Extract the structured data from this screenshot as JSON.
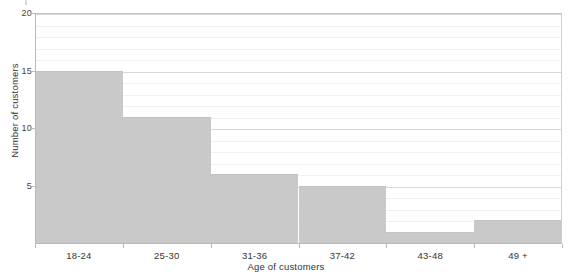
{
  "chart_data": {
    "type": "bar",
    "title": "",
    "subtitle": "",
    "xlabel": "Age of customers",
    "ylabel": "Number of customers",
    "categories": [
      "18-24",
      "25-30",
      "31-36",
      "37-42",
      "43-48",
      "49 +"
    ],
    "values": [
      15,
      11,
      6,
      5,
      1,
      2
    ],
    "series": [
      {
        "name": "Number of customers",
        "values": [
          15,
          11,
          6,
          5,
          1,
          2
        ]
      }
    ],
    "ylim": [
      0,
      20
    ],
    "ytick_labels": [
      "5",
      "10",
      "15",
      "20"
    ],
    "ytick_values": [
      5,
      10,
      15,
      20
    ],
    "y_major_step": 5,
    "y_minor_step": 1,
    "grid": true,
    "grid_axis": "y",
    "legend": false,
    "legend_position": "none",
    "bar_color": "#c9c9c9",
    "bar_edge_color": "#c2c2c2",
    "axis_color": "#b9b9b9",
    "gridline_color_minor": "#f0f0f0",
    "gridline_color_major": "#d8d8d8",
    "text_color": "#333333",
    "background": "#ffffff",
    "bar_gap": 0,
    "annotations": []
  }
}
